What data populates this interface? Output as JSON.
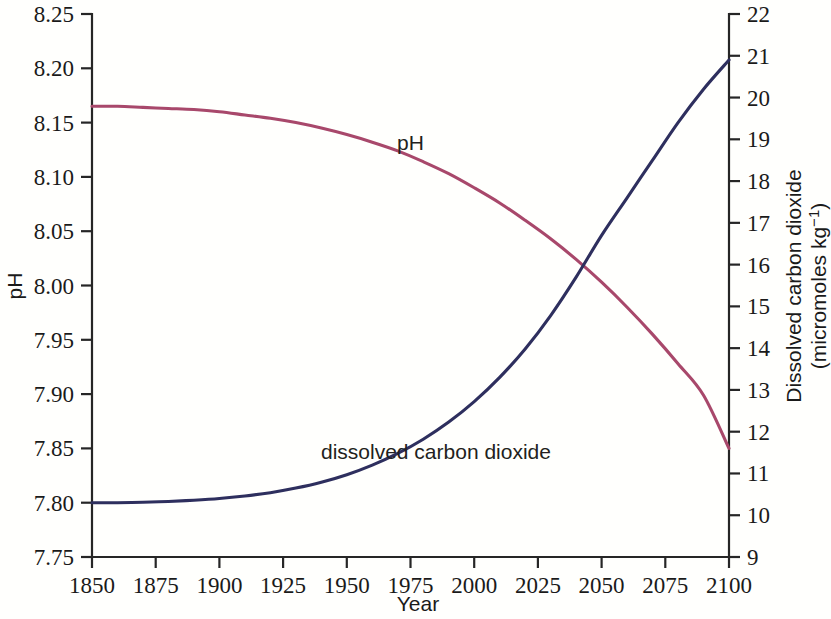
{
  "figure": {
    "background_color": "#fffffd",
    "axis_color": "#262626"
  },
  "chart_data": {
    "type": "line",
    "title": "",
    "xlabel": "Year",
    "ylabel": "pH",
    "y2label": "Dissolved carbon dioxide (micromoles kg⁻¹)",
    "y2label_line1": "Dissolved carbon dioxide",
    "y2label_line2_prefix": "(micromoles kg",
    "y2label_line2_exponent": "−1",
    "y2label_line2_suffix": ")",
    "xlim": [
      1850,
      2100
    ],
    "ylim": [
      7.75,
      8.25
    ],
    "y2lim": [
      9,
      22
    ],
    "grid": false,
    "legend_position": "inline-annotations",
    "x_ticks": [
      1850,
      1875,
      1900,
      1925,
      1950,
      1975,
      2000,
      2025,
      2050,
      2075,
      2100
    ],
    "x_tick_labels": [
      "1850",
      "1875",
      "1900",
      "1925",
      "1950",
      "1975",
      "2000",
      "2025",
      "2050",
      "2075",
      "2100"
    ],
    "y_ticks": [
      7.75,
      7.8,
      7.85,
      7.9,
      7.95,
      8.0,
      8.05,
      8.1,
      8.15,
      8.2,
      8.25
    ],
    "y_tick_labels": [
      "7.75",
      "7.80",
      "7.85",
      "7.90",
      "7.95",
      "8.00",
      "8.05",
      "8.10",
      "8.15",
      "8.20",
      "8.25"
    ],
    "y2_ticks": [
      9,
      10,
      11,
      12,
      13,
      14,
      15,
      16,
      17,
      18,
      19,
      20,
      21,
      22
    ],
    "y2_tick_labels": [
      "9",
      "10",
      "11",
      "12",
      "13",
      "14",
      "15",
      "16",
      "17",
      "18",
      "19",
      "20",
      "21",
      "22"
    ],
    "series": [
      {
        "name": "pH",
        "axis": "left",
        "color": "#a8486b",
        "annotation": "pH",
        "annotation_x": 1975,
        "annotation_y": 8.125,
        "x": [
          1850,
          1860,
          1870,
          1880,
          1890,
          1900,
          1910,
          1920,
          1930,
          1940,
          1950,
          1960,
          1970,
          1980,
          1990,
          2000,
          2010,
          2020,
          2030,
          2040,
          2050,
          2060,
          2070,
          2080,
          2090,
          2100
        ],
        "values": [
          8.165,
          8.165,
          8.164,
          8.163,
          8.162,
          8.16,
          8.157,
          8.154,
          8.15,
          8.145,
          8.139,
          8.132,
          8.124,
          8.114,
          8.103,
          8.09,
          8.076,
          8.06,
          8.043,
          8.024,
          8.003,
          7.98,
          7.955,
          7.928,
          7.899,
          7.85
        ]
      },
      {
        "name": "dissolved carbon dioxide",
        "axis": "right",
        "color": "#2e2f5e",
        "annotation": "dissolved carbon dioxide",
        "annotation_x": 1985,
        "annotation_y_right": 11.35,
        "x": [
          1850,
          1860,
          1870,
          1880,
          1890,
          1900,
          1910,
          1920,
          1930,
          1940,
          1950,
          1960,
          1970,
          1980,
          1990,
          2000,
          2010,
          2020,
          2030,
          2040,
          2050,
          2060,
          2070,
          2080,
          2090,
          2100
        ],
        "values": [
          10.3,
          10.3,
          10.31,
          10.33,
          10.36,
          10.4,
          10.46,
          10.54,
          10.65,
          10.79,
          10.97,
          11.2,
          11.48,
          11.82,
          12.23,
          12.72,
          13.3,
          13.98,
          14.78,
          15.7,
          16.7,
          17.6,
          18.5,
          19.4,
          20.2,
          20.9
        ]
      }
    ]
  }
}
